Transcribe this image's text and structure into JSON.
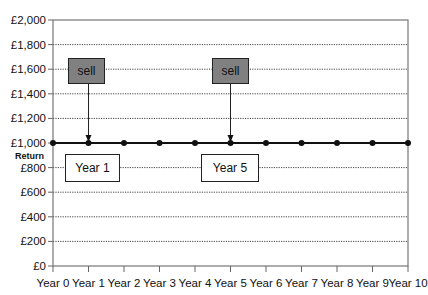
{
  "chart_data": {
    "type": "line",
    "title": "",
    "xlabel": "",
    "ylabel": "Return",
    "x": [
      "Year 0",
      "Year 1",
      "Year 2",
      "Year 3",
      "Year 4",
      "Year 5",
      "Year 6",
      "Year 7",
      "Year 8",
      "Year 9",
      "Year 10"
    ],
    "series": [
      {
        "name": "Return",
        "values": [
          1000,
          1000,
          1000,
          1000,
          1000,
          1000,
          1000,
          1000,
          1000,
          1000,
          1000
        ]
      }
    ],
    "y_ticks": [
      "£0",
      "£200",
      "£400",
      "£600",
      "£800",
      "£1,000",
      "£1,200",
      "£1,400",
      "£1,600",
      "£1,800",
      "£2,000"
    ],
    "ylim": [
      0,
      2000
    ],
    "grid": "horizontal dotted",
    "annotations": [
      {
        "label": "sell",
        "x": "Year 1",
        "arrow_to": 1000
      },
      {
        "label": "sell",
        "x": "Year 5",
        "arrow_to": 1000
      },
      {
        "label": "Year 1",
        "x": "Year 1"
      },
      {
        "label": "Year 5",
        "x": "Year 5"
      }
    ]
  },
  "labels": {
    "y_axis_title": "Return",
    "sell1": "sell",
    "sell2": "sell",
    "year1": "Year 1",
    "year5": "Year 5"
  }
}
